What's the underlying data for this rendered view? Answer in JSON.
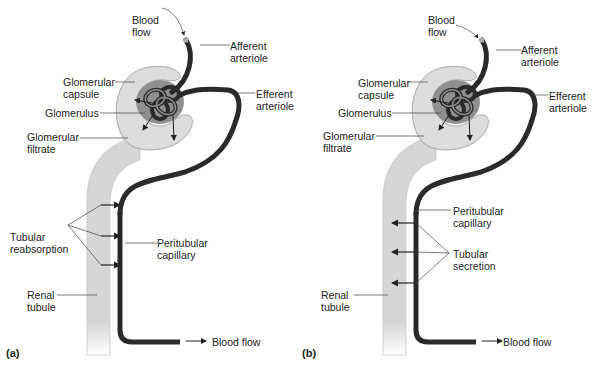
{
  "figure": {
    "panels": [
      {
        "id": "a",
        "letter": "(a)",
        "process": "Tubular reabsorption",
        "labels": {
          "blood_flow_in": "Blood\nflow",
          "afferent": "Afferent\narteriole",
          "efferent": "Efferent\narteriole",
          "capsule": "Glomerular\ncapsule",
          "glomerulus": "Glomerulus",
          "filtrate": "Glomerular\nfiltrate",
          "process": "Tubular\nreabsorption",
          "peritubular": "Peritubular\ncapillary",
          "tubule": "Renal\ntubule",
          "blood_flow_out": "Blood flow"
        },
        "arrow_direction": "tubule-to-capillary"
      },
      {
        "id": "b",
        "letter": "(b)",
        "process": "Tubular secretion",
        "labels": {
          "blood_flow_in": "Blood\nflow",
          "afferent": "Afferent\narteriole",
          "efferent": "Efferent\narteriole",
          "capsule": "Glomerular\ncapsule",
          "glomerulus": "Glomerulus",
          "filtrate": "Glomerular\nfiltrate",
          "process": "Tubular\nsecretion",
          "peritubular": "Peritubular\ncapillary",
          "tubule": "Renal\ntubule",
          "blood_flow_out": "Blood flow"
        },
        "arrow_direction": "capillary-to-tubule"
      }
    ],
    "colors": {
      "vessel": "#2a2a2a",
      "tubule": "#d9d9d9",
      "capsule_outer": "#dcdcdc",
      "capsule_inner": "#8c8c8c",
      "text": "#222222",
      "leader": "#444444"
    }
  }
}
